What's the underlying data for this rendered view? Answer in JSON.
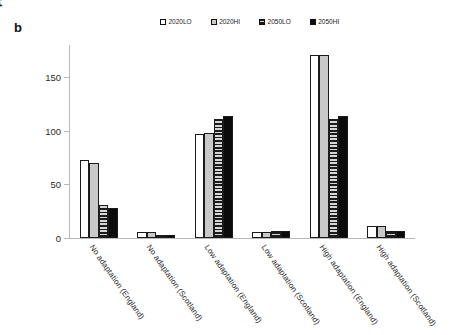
{
  "figure": {
    "panel_label": "b"
  },
  "legend": {
    "position": "top-center",
    "items": [
      {
        "label": "2020LO",
        "swatch": "white-open-square-icon",
        "color": "#ffffff"
      },
      {
        "label": "2020HI",
        "swatch": "light-dotted-square-icon",
        "color": "#c9c9c9"
      },
      {
        "label": "2050LO",
        "swatch": "dark-striped-square-icon",
        "color": "#8c8c8c"
      },
      {
        "label": "2050HI",
        "swatch": "black-filled-square-icon",
        "color": "#0b0b0b"
      }
    ]
  },
  "axes": {
    "y_title": "Present value (£M)",
    "y_ticks": [
      0,
      50,
      100,
      150
    ],
    "y_tick_labels": [
      "0",
      "50",
      "100",
      "150"
    ],
    "x_title": ""
  },
  "chart_data": {
    "type": "bar",
    "title": "",
    "subtitle": "",
    "xlabel": "",
    "ylabel": "Present value (£M)",
    "ylim": [
      0,
      180
    ],
    "yticks": [
      0,
      50,
      100,
      150
    ],
    "grid": false,
    "legend_position": "top-center",
    "categories": [
      "No adaptation (England)",
      "No adaptation (Scotland)",
      "Low adaptation (England)",
      "Low adaptation (Scotland)",
      "High adaptation (England)",
      "High adaptation (Scotland)"
    ],
    "series": [
      {
        "name": "2020LO",
        "values": [
          73,
          6,
          97,
          6,
          171,
          11
        ]
      },
      {
        "name": "2020HI",
        "values": [
          70,
          6,
          98,
          6,
          171,
          11
        ]
      },
      {
        "name": "2050LO",
        "values": [
          31,
          3,
          111,
          7,
          111,
          7
        ]
      },
      {
        "name": "2050HI",
        "values": [
          28,
          3,
          114,
          7,
          114,
          7
        ]
      }
    ]
  }
}
